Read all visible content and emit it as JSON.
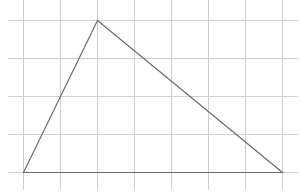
{
  "diagram": {
    "type": "triangle-on-grid",
    "grid": {
      "vertical_lines_x": [
        23,
        60,
        97,
        134,
        171,
        208,
        245,
        282
      ],
      "horizontal_lines_y": [
        20,
        58,
        96,
        134,
        172
      ],
      "h_extent": [
        8,
        298
      ],
      "v_extent": [
        0,
        190
      ],
      "color": "#cfcfcf"
    },
    "triangle": {
      "vertices": [
        {
          "x": 23,
          "y": 172,
          "grid": [
            0,
            0
          ]
        },
        {
          "x": 97,
          "y": 20,
          "grid": [
            2,
            4
          ]
        },
        {
          "x": 282,
          "y": 172,
          "grid": [
            7,
            0
          ]
        }
      ],
      "stroke": "#6e6e6e"
    }
  }
}
